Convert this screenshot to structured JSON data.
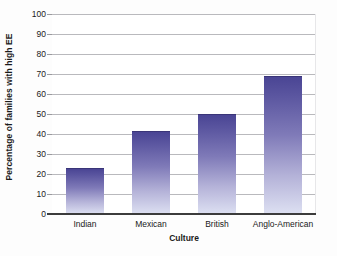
{
  "chart_data": {
    "type": "bar",
    "title": "",
    "subtitle": "",
    "xlabel": "Culture",
    "ylabel": "Percentage of families with high EE",
    "categories": [
      "Indian",
      "Mexican",
      "British",
      "Anglo-American"
    ],
    "values": [
      23,
      41.5,
      50,
      69
    ],
    "series": [
      {
        "name": "Percentage of families with high EE",
        "values": [
          23,
          41.5,
          50,
          69
        ]
      }
    ],
    "ylim": [
      0,
      100
    ],
    "ytick_step": 10,
    "yticks": [
      0,
      10,
      20,
      30,
      40,
      50,
      60,
      70,
      80,
      90,
      100
    ],
    "ytick_labels": [
      "0",
      "10",
      "20",
      "30",
      "40",
      "50",
      "60",
      "70",
      "80",
      "90",
      "100"
    ],
    "grid": "horizontal",
    "legend": "none",
    "legend_position": "none",
    "annotations": []
  },
  "style": {
    "bar_color_top": "#4a4594",
    "bar_color_bottom": "#dde0f2",
    "bar_edge_color": "#3a3578",
    "gridline_color": "#b9b9bd",
    "axis_color": "#3c3c3c",
    "text_color": "#1a1a1a",
    "plot_background": "#ffffff",
    "figure_background": "#fdfdfd"
  }
}
